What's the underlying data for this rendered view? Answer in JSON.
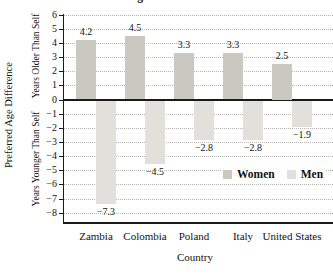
{
  "title": "Preferred Age Difference in a Mate",
  "colors": {
    "women_bar": "#cac9c1",
    "men_bar": "#e1e0da",
    "gridline": "#b4b4b0",
    "axis": "#1a1a1a"
  },
  "y_axis": {
    "label": "Preferred Age Difference",
    "upper_label": "Years Older Than Self",
    "lower_label": "Years Younger Than Self",
    "ticks": [
      6,
      5,
      4,
      3,
      2,
      1,
      0,
      -1,
      -2,
      -3,
      -4,
      -5,
      -6,
      -7,
      -8
    ]
  },
  "x_axis": {
    "label": "Country"
  },
  "legend": {
    "women_label": "Women",
    "men_label": "Men"
  },
  "chart_data": {
    "type": "bar",
    "categories": [
      "Zambia",
      "Colombia",
      "Poland",
      "Italy",
      "United States"
    ],
    "series": [
      {
        "name": "Women",
        "values": [
          4.2,
          4.5,
          3.3,
          3.3,
          2.5
        ]
      },
      {
        "name": "Men",
        "values": [
          -7.3,
          -4.5,
          -2.8,
          -2.8,
          -1.9
        ]
      }
    ],
    "title": "Preferred Age Difference in a Mate",
    "xlabel": "Country",
    "ylabel": "Preferred Age Difference",
    "ylim": [
      -8,
      6
    ],
    "grid": true,
    "legend_position": "inside lower right"
  }
}
